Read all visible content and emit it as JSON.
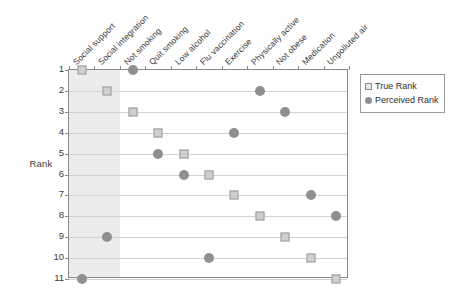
{
  "chart_data": {
    "type": "scatter",
    "title": "",
    "xlabel": "",
    "ylabel": "Rank",
    "ylim": [
      1,
      11
    ],
    "y_inverted": true,
    "grid": true,
    "legend_position": "right",
    "categories": [
      "Social support",
      "Social integration",
      "Not smoking",
      "Quit smoking",
      "Low alcohol",
      "Flu vaccination",
      "Exercise",
      "Physically active",
      "Not obese",
      "Medication",
      "Unpolluted air"
    ],
    "y_ticks": [
      1,
      2,
      3,
      4,
      5,
      6,
      7,
      8,
      9,
      10,
      11
    ],
    "series": [
      {
        "name": "True Rank",
        "marker": "square",
        "color": "#cfcfcf",
        "values": [
          1,
          2,
          3,
          4,
          5,
          6,
          7,
          8,
          9,
          10,
          11
        ]
      },
      {
        "name": "Perceived Rank",
        "marker": "circle",
        "color": "#8f8f8f",
        "values": [
          11,
          9,
          1,
          5,
          6,
          10,
          4,
          2,
          3,
          7,
          8
        ]
      }
    ],
    "highlight_band": {
      "label": "",
      "start_category_index": 0,
      "end_category_index": 1,
      "color": "#ececec"
    }
  },
  "legend": {
    "items": [
      {
        "label": "True Rank",
        "marker": "square"
      },
      {
        "label": "Perceived Rank",
        "marker": "circle"
      }
    ]
  },
  "axis": {
    "y_title": "Rank"
  },
  "colors": {
    "true_rank": "#cfcfcf",
    "perceived_rank": "#8f8f8f",
    "gridline": "#d2d2d2",
    "axis": "#8a8a8a",
    "band": "#ececec"
  }
}
